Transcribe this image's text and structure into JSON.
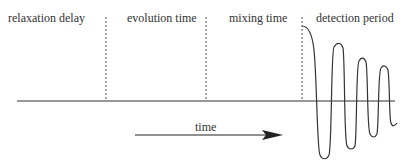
{
  "diagram": {
    "periods": [
      {
        "label": "relaxation delay"
      },
      {
        "label": "evolution time"
      },
      {
        "label": "mixing time"
      },
      {
        "label": "detection period"
      }
    ],
    "arrow_label": "time",
    "colors": {
      "line": "#333333",
      "dashed": "#555555",
      "text": "#333333",
      "background": "#ffffff"
    }
  }
}
